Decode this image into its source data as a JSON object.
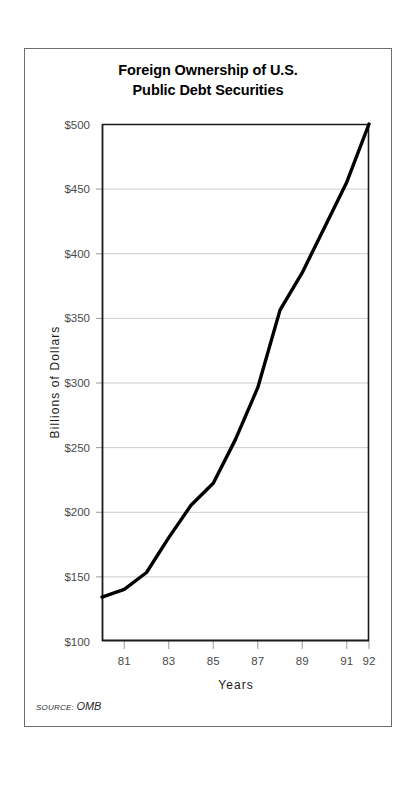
{
  "figure": {
    "title_line_1": "Foreign Ownership of U.S.",
    "title_line_2": "Public Debt Securities",
    "source_label": "SOURCE:",
    "source_value": "OMB",
    "frame_color": "#6e6e6e",
    "line_color": "#000000",
    "grid_color": "#cccccc",
    "axis_color": "#1a1a1a"
  },
  "chart_data": {
    "type": "line",
    "title": "Foreign Ownership of U.S. Public Debt Securities",
    "subtitle": "",
    "xlabel": "Years",
    "ylabel": "Billions of Dollars",
    "xlim": [
      1980,
      1992
    ],
    "ylim": [
      100,
      500
    ],
    "grid": true,
    "legend": false,
    "x_tick_labels": [
      "81",
      "83",
      "85",
      "87",
      "89",
      "91",
      "92"
    ],
    "x_tick_values": [
      1981,
      1983,
      1985,
      1987,
      1989,
      1991,
      1992
    ],
    "y_tick_labels": [
      "$100",
      "$150",
      "$200",
      "$250",
      "$300",
      "$350",
      "$400",
      "$450",
      "$500"
    ],
    "y_tick_values": [
      100,
      150,
      200,
      250,
      300,
      350,
      400,
      450,
      500
    ],
    "x": [
      1980,
      1981,
      1982,
      1983,
      1984,
      1985,
      1986,
      1987,
      1988,
      1989,
      1990,
      1991,
      1992
    ],
    "series": [
      {
        "name": "Foreign ownership of U.S. public debt securities",
        "values": [
          134,
          140,
          153,
          180,
          205,
          222,
          256,
          296,
          356,
          385,
          420,
          455,
          500
        ]
      }
    ],
    "annotations": [
      "SOURCE: OMB"
    ]
  }
}
